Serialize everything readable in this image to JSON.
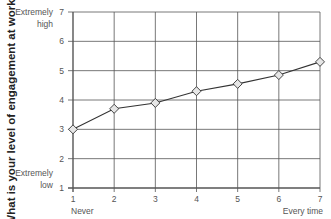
{
  "chart_data": {
    "type": "line",
    "title": "",
    "xlabel": "",
    "ylabel": "What is your level of engagement at work?",
    "x": [
      1,
      2,
      3,
      4,
      5,
      6,
      7
    ],
    "categories": [
      "1",
      "2",
      "3",
      "4",
      "5",
      "6",
      "7"
    ],
    "series": [
      {
        "name": "Engagement",
        "values": [
          3.0,
          3.7,
          3.9,
          4.3,
          4.55,
          4.85,
          5.3
        ]
      }
    ],
    "xlim": [
      1,
      7
    ],
    "ylim": [
      1,
      7
    ],
    "x_ticks": [
      "1",
      "2",
      "3",
      "4",
      "5",
      "6",
      "7"
    ],
    "y_ticks": [
      "1",
      "2",
      "3",
      "4",
      "5",
      "6",
      "7"
    ],
    "x_tick_annotations": {
      "1": "Never",
      "7": "Every time"
    },
    "y_tick_annotations": {
      "7": [
        "Extremely",
        "high"
      ],
      "1": [
        "Extremely",
        "low"
      ]
    },
    "grid": true,
    "legend": "none",
    "marker": "diamond",
    "colors": {
      "line": "#333333",
      "marker_fill": "#e6e6e6",
      "grid": "#555555",
      "text": "#555555"
    }
  }
}
